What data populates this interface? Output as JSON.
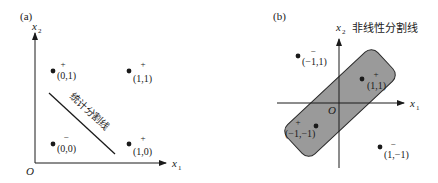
{
  "panel_a": {
    "tag": "(a)",
    "axis_x": "x",
    "axis_x_sub": "1",
    "axis_y": "x",
    "axis_y_sub": "2",
    "origin": "O",
    "separator_label": "统计分割线",
    "points": [
      {
        "coord": "(0,1)",
        "sign": "+"
      },
      {
        "coord": "(1,1)",
        "sign": "+"
      },
      {
        "coord": "(0,0)",
        "sign": "−"
      },
      {
        "coord": "(1,0)",
        "sign": "+"
      }
    ]
  },
  "panel_b": {
    "tag": "(b)",
    "axis_x": "x",
    "axis_x_sub": "1",
    "axis_y": "x",
    "axis_y_sub": "2",
    "origin": "O",
    "separator_label": "非线性分割线",
    "region_color": "#9a9a9a",
    "points": [
      {
        "coord": "(−1,1)",
        "sign": "−"
      },
      {
        "coord": "(1,1)",
        "sign": "+"
      },
      {
        "coord": "(−1,−1)",
        "sign": "+"
      },
      {
        "coord": "(1,−1)",
        "sign": "−"
      }
    ]
  }
}
